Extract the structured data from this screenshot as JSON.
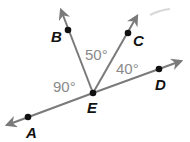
{
  "diagram": {
    "type": "geometry-angles",
    "vertex": "E",
    "colors": {
      "ray": "#7a7a7a",
      "point": "#111111",
      "point_label": "#111111",
      "angle_label": "#8a8a8a",
      "background": "#ffffff"
    },
    "points": {
      "A": {
        "label": "A"
      },
      "B": {
        "label": "B"
      },
      "C": {
        "label": "C"
      },
      "D": {
        "label": "D"
      },
      "E": {
        "label": "E"
      }
    },
    "rays": [
      "EA",
      "EB",
      "EC",
      "ED"
    ],
    "angles": {
      "AEB": {
        "label": "90°",
        "value": 90
      },
      "BEC": {
        "label": "50°",
        "value": 50
      },
      "CED": {
        "label": "40°",
        "value": 40
      }
    }
  }
}
